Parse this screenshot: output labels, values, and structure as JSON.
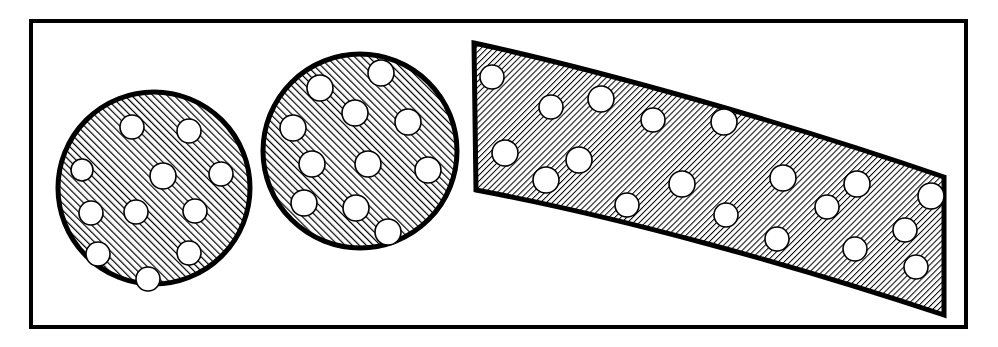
{
  "figure": {
    "caption": "",
    "background_color": "#ffffff",
    "ink_color": "#000000",
    "inclusion_fill_color": "#ffffff",
    "canvas": {
      "width": 998,
      "height": 347
    }
  },
  "frame": {
    "name": "figure-border",
    "x": 31,
    "y": 21,
    "width": 935,
    "height": 306,
    "stroke_width": 4,
    "stroke_color": "#000000",
    "fill": "none"
  },
  "hatching": {
    "circle_pattern": {
      "direction": "forward-slash",
      "angle_degrees": 45,
      "spacing": 5,
      "line_width": 2.4,
      "color": "#000000"
    },
    "band_pattern": {
      "direction": "back-slash",
      "angle_degrees": -45,
      "spacing": 4.2,
      "line_width": 2.0,
      "color": "#000000"
    }
  },
  "shapes": [
    {
      "id": "circle-left",
      "label": "Left circular cross-section",
      "type": "circle",
      "cx": 154,
      "cy": 188,
      "r": 96,
      "outline_width": 5,
      "hatch": "circle_pattern",
      "inclusion_count": 11,
      "inclusions": [
        {
          "cx": 132,
          "cy": 127,
          "r": 12
        },
        {
          "cx": 189,
          "cy": 131,
          "r": 12
        },
        {
          "cx": 82,
          "cy": 170,
          "r": 11
        },
        {
          "cx": 163,
          "cy": 176,
          "r": 13
        },
        {
          "cx": 221,
          "cy": 174,
          "r": 12
        },
        {
          "cx": 91,
          "cy": 213,
          "r": 12
        },
        {
          "cx": 136,
          "cy": 212,
          "r": 12
        },
        {
          "cx": 195,
          "cy": 211,
          "r": 12
        },
        {
          "cx": 98,
          "cy": 254,
          "r": 12
        },
        {
          "cx": 189,
          "cy": 253,
          "r": 12
        },
        {
          "cx": 148,
          "cy": 279,
          "r": 12
        }
      ]
    },
    {
      "id": "circle-middle",
      "label": "Middle circular cross-section",
      "type": "circle",
      "cx": 360,
      "cy": 151,
      "r": 97,
      "outline_width": 5,
      "hatch": "circle_pattern",
      "inclusion_count": 11,
      "inclusions": [
        {
          "cx": 381,
          "cy": 73,
          "r": 13
        },
        {
          "cx": 320,
          "cy": 88,
          "r": 13
        },
        {
          "cx": 355,
          "cy": 113,
          "r": 13
        },
        {
          "cx": 293,
          "cy": 128,
          "r": 13
        },
        {
          "cx": 408,
          "cy": 122,
          "r": 13
        },
        {
          "cx": 312,
          "cy": 164,
          "r": 13
        },
        {
          "cx": 368,
          "cy": 164,
          "r": 13
        },
        {
          "cx": 428,
          "cy": 170,
          "r": 13
        },
        {
          "cx": 304,
          "cy": 203,
          "r": 13
        },
        {
          "cx": 356,
          "cy": 208,
          "r": 13
        },
        {
          "cx": 388,
          "cy": 232,
          "r": 13
        }
      ]
    },
    {
      "id": "band-curved",
      "label": "Curved hatched band",
      "type": "band",
      "outline_width": 5,
      "hatch": "band_pattern",
      "path": "M 474 43 C 600 70, 790 124, 944 177 L 944 315 C 790 264, 620 217, 476 190 Z",
      "top_edge": {
        "start": [
          474,
          43
        ],
        "control": [
          690,
          95
        ],
        "end": [
          944,
          177
        ]
      },
      "bottom_edge": {
        "start": [
          476,
          190
        ],
        "control": [
          700,
          238
        ],
        "end": [
          944,
          315
        ]
      },
      "left_edge": {
        "start": [
          474,
          43
        ],
        "end": [
          476,
          190
        ]
      },
      "right_edge": {
        "start": [
          944,
          177
        ],
        "end": [
          944,
          315
        ]
      },
      "inclusion_count": 19,
      "inclusions": [
        {
          "cx": 492,
          "cy": 77,
          "r": 12
        },
        {
          "cx": 551,
          "cy": 107,
          "r": 12
        },
        {
          "cx": 601,
          "cy": 99,
          "r": 13
        },
        {
          "cx": 653,
          "cy": 120,
          "r": 12
        },
        {
          "cx": 724,
          "cy": 122,
          "r": 13
        },
        {
          "cx": 505,
          "cy": 153,
          "r": 13
        },
        {
          "cx": 546,
          "cy": 180,
          "r": 13
        },
        {
          "cx": 579,
          "cy": 160,
          "r": 13
        },
        {
          "cx": 627,
          "cy": 205,
          "r": 12
        },
        {
          "cx": 682,
          "cy": 184,
          "r": 13
        },
        {
          "cx": 726,
          "cy": 215,
          "r": 12
        },
        {
          "cx": 783,
          "cy": 178,
          "r": 13
        },
        {
          "cx": 777,
          "cy": 239,
          "r": 12
        },
        {
          "cx": 827,
          "cy": 207,
          "r": 12
        },
        {
          "cx": 857,
          "cy": 184,
          "r": 13
        },
        {
          "cx": 855,
          "cy": 249,
          "r": 12
        },
        {
          "cx": 905,
          "cy": 230,
          "r": 12
        },
        {
          "cx": 931,
          "cy": 196,
          "r": 13
        },
        {
          "cx": 916,
          "cy": 267,
          "r": 12
        }
      ]
    }
  ]
}
